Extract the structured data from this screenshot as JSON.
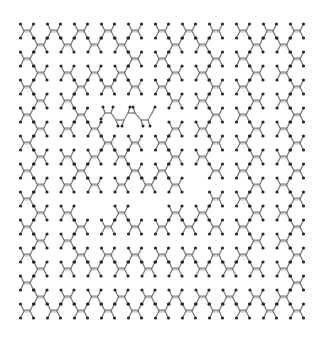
{
  "figure": {
    "kind": "molecular-lattice",
    "colors": {
      "bond": "#7a7a7a",
      "atom": "#2a2a2a",
      "background": "#ffffff"
    },
    "grid": {
      "origin_x": 27,
      "origin_y": 31,
      "col_step": 13.5,
      "row_step": 14,
      "cols": 21,
      "rows": 21
    },
    "rows": [
      {
        "r": 0,
        "cols": [
          0,
          2,
          4,
          6,
          8,
          10,
          12,
          14,
          16,
          18,
          20
        ]
      },
      {
        "r": 1,
        "cols": [
          1,
          3,
          5,
          7,
          11,
          13,
          17,
          19
        ]
      },
      {
        "r": 2,
        "cols": [
          0,
          8,
          10,
          14,
          16,
          20
        ]
      },
      {
        "r": 3,
        "cols": [
          1,
          3,
          5,
          7,
          11,
          13,
          17,
          19
        ]
      },
      {
        "r": 4,
        "cols": [
          0,
          4,
          6,
          8,
          10,
          14,
          16,
          20
        ]
      },
      {
        "r": 5,
        "cols": [
          1,
          3,
          11,
          13,
          17,
          19
        ]
      },
      {
        "r": 6,
        "cols": [
          0,
          4,
          14,
          16,
          20
        ]
      },
      {
        "r": 7,
        "cols": [
          1,
          3,
          5,
          11,
          13,
          17,
          19
        ]
      },
      {
        "r": 8,
        "cols": [
          0,
          6,
          8,
          10,
          14,
          16,
          20
        ]
      },
      {
        "r": 9,
        "cols": [
          1,
          3,
          5,
          7,
          11,
          13,
          17,
          19
        ]
      },
      {
        "r": 10,
        "cols": [
          0,
          4,
          8,
          10,
          14,
          16,
          20
        ]
      },
      {
        "r": 11,
        "cols": [
          1,
          3,
          5,
          7,
          9,
          11,
          17,
          19
        ]
      },
      {
        "r": 12,
        "cols": [
          0,
          14,
          16,
          20
        ]
      },
      {
        "r": 13,
        "cols": [
          1,
          3,
          7,
          11,
          13,
          17,
          19
        ]
      },
      {
        "r": 14,
        "cols": [
          0,
          4,
          6,
          8,
          10,
          12,
          14,
          16,
          20
        ]
      },
      {
        "r": 15,
        "cols": [
          1,
          3,
          17,
          19
        ]
      },
      {
        "r": 16,
        "cols": [
          0,
          4,
          6,
          8,
          10,
          12,
          14,
          16,
          20
        ]
      },
      {
        "r": 17,
        "cols": [
          1,
          3,
          5,
          7,
          9,
          11,
          13,
          15,
          17,
          19
        ]
      },
      {
        "r": 18,
        "cols": [
          0,
          20
        ]
      },
      {
        "r": 19,
        "cols": [
          1,
          3,
          5,
          7,
          9,
          11,
          13,
          15,
          17,
          19
        ]
      },
      {
        "r": 20,
        "cols": [
          0,
          2,
          4,
          6,
          8,
          10,
          12,
          14,
          16,
          18,
          20
        ]
      }
    ],
    "chain": {
      "points": [
        [
          101,
          119
        ],
        [
          105,
          113
        ],
        [
          111,
          113
        ],
        [
          116,
          120
        ],
        [
          124,
          120
        ],
        [
          128,
          113
        ],
        [
          135,
          113
        ],
        [
          141,
          120
        ],
        [
          148,
          120
        ],
        [
          152,
          113
        ]
      ],
      "hydrogens": [
        [
          103,
          107
        ],
        [
          113,
          107
        ],
        [
          118,
          126
        ],
        [
          122,
          126
        ],
        [
          130,
          107
        ],
        [
          133,
          107
        ],
        [
          143,
          126
        ],
        [
          150,
          126
        ],
        [
          155,
          107
        ]
      ]
    }
  }
}
